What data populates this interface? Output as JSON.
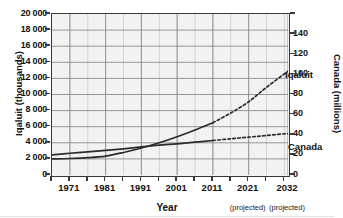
{
  "chart_data": {
    "type": "line",
    "title": "",
    "xlabel": "Year",
    "ylabel_left": "Iqaluit (thousands)",
    "ylabel_right": "Canada (millions)",
    "xlim": [
      1966,
      2032
    ],
    "ylim_left": [
      0,
      20000
    ],
    "ylim_right": [
      0,
      160
    ],
    "grid": true,
    "legend_position": "inline-labels",
    "x_ticks": [
      {
        "value": 1971,
        "label": "1971",
        "sublabel": ""
      },
      {
        "value": 1981,
        "label": "1981",
        "sublabel": ""
      },
      {
        "value": 1991,
        "label": "1991",
        "sublabel": ""
      },
      {
        "value": 2001,
        "label": "2001",
        "sublabel": ""
      },
      {
        "value": 2011,
        "label": "2011",
        "sublabel": ""
      },
      {
        "value": 2021,
        "label": "2021",
        "sublabel": "(projected)"
      },
      {
        "value": 2032,
        "label": "2032",
        "sublabel": "(projected)"
      }
    ],
    "y_ticks_left": [
      {
        "value": 0,
        "label": "0"
      },
      {
        "value": 2000,
        "label": "2 000"
      },
      {
        "value": 4000,
        "label": "4 000"
      },
      {
        "value": 6000,
        "label": "6 000"
      },
      {
        "value": 8000,
        "label": "8 000"
      },
      {
        "value": 10000,
        "label": "10 000"
      },
      {
        "value": 12000,
        "label": "12 000"
      },
      {
        "value": 14000,
        "label": "14 000"
      },
      {
        "value": 16000,
        "label": "16 000"
      },
      {
        "value": 18000,
        "label": "18 000"
      },
      {
        "value": 20000,
        "label": "20 000"
      }
    ],
    "y_ticks_right": [
      {
        "value": 0,
        "label": "0"
      },
      {
        "value": 20,
        "label": "20"
      },
      {
        "value": 40,
        "label": "40"
      },
      {
        "value": 60,
        "label": "60"
      },
      {
        "value": 80,
        "label": "80"
      },
      {
        "value": 100,
        "label": "100"
      },
      {
        "value": 120,
        "label": "120"
      },
      {
        "value": 140,
        "label": "140"
      }
    ],
    "series": [
      {
        "name": "Iqaluit",
        "label": "Iqaluit",
        "axis": "left",
        "units": "thousands",
        "color": "#2b2b2b",
        "actual": {
          "x": [
            1966,
            1971,
            1976,
            1981,
            1986,
            1991,
            1996,
            2001,
            2006,
            2011
          ],
          "y": [
            2000,
            2050,
            2150,
            2350,
            2800,
            3350,
            4000,
            4750,
            5600,
            6500
          ]
        },
        "projected": {
          "x": [
            2011,
            2016,
            2021,
            2026,
            2032
          ],
          "y": [
            6500,
            7700,
            9100,
            10900,
            12900
          ]
        }
      },
      {
        "name": "Canada",
        "label": "Canada",
        "axis": "right",
        "units": "millions",
        "color": "#2b2b2b",
        "actual": {
          "x": [
            1966,
            1971,
            1976,
            1981,
            1986,
            1991,
            1996,
            2001,
            2006,
            2011
          ],
          "y": [
            20.0,
            21.6,
            23.0,
            24.4,
            26.0,
            27.9,
            29.6,
            31.0,
            32.6,
            34.3
          ]
        },
        "projected": {
          "x": [
            2011,
            2016,
            2021,
            2026,
            2032
          ],
          "y": [
            34.3,
            36.0,
            37.6,
            39.3,
            41.2
          ]
        }
      }
    ]
  },
  "axes": {
    "x_title": "Year",
    "y_left_title": "Iqaluit (thousands)",
    "y_right_title": "Canada (millions)"
  },
  "labels": {
    "iqaluit": "Iqaluit",
    "canada": "Canada"
  },
  "colors": {
    "plot_background": "#f2f2f2",
    "frame": "#3a3a3a",
    "gridline_major": "#8c8c8c",
    "gridline_minor": "#c9c9c9",
    "series": "#2b2b2b",
    "text": "#111111"
  }
}
